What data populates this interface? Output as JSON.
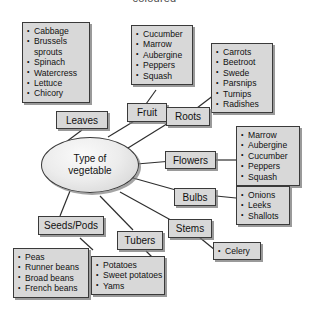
{
  "page": {
    "cropped_caption": "coloured",
    "center_label": "Type of\nvegetable",
    "center_label_line1": "Type of",
    "center_label_line2": "vegetable"
  },
  "colors": {
    "box_fill": "#d8d8d8",
    "box_border": "#3a3a3a",
    "shadow": "#9a9a9a",
    "background": "#ffffff",
    "text": "#111111"
  },
  "categories": {
    "leaves": {
      "label": "Leaves"
    },
    "fruit": {
      "label": "Fruit"
    },
    "roots": {
      "label": "Roots"
    },
    "flowers": {
      "label": "Flowers"
    },
    "bulbs": {
      "label": "Bulbs"
    },
    "stems": {
      "label": "Stems"
    },
    "tubers": {
      "label": "Tubers"
    },
    "seeds_pods": {
      "label": "Seeds/Pods"
    }
  },
  "lists": {
    "leaves": {
      "items": [
        "Cabbage",
        "Brussels",
        "sprouts",
        "Spinach",
        "Watercress",
        "Lettuce",
        "Chicory"
      ],
      "continuation_indexes": [
        2
      ]
    },
    "fruit": {
      "items": [
        "Cucumber",
        "Marrow",
        "Aubergine",
        "Peppers",
        "Squash"
      ],
      "continuation_indexes": []
    },
    "roots": {
      "items": [
        "Carrots",
        "Beetroot",
        "Swede",
        "Parsnips",
        "Turnips",
        "Radishes"
      ],
      "continuation_indexes": []
    },
    "flowers": {
      "items": [
        "Marrow",
        "Aubergine",
        "Cucumber",
        "Peppers",
        "Squash"
      ],
      "continuation_indexes": []
    },
    "bulbs": {
      "items": [
        "Onions",
        "Leeks",
        "Shallots"
      ],
      "continuation_indexes": []
    },
    "stems": {
      "items": [
        "Celery"
      ],
      "continuation_indexes": []
    },
    "tubers": {
      "items": [
        "Potatoes",
        "Sweet potatoes",
        "Yams"
      ],
      "continuation_indexes": []
    },
    "seeds_pods": {
      "items": [
        "Peas",
        "Runner beans",
        "Broad beans",
        "French beans"
      ],
      "continuation_indexes": []
    }
  }
}
